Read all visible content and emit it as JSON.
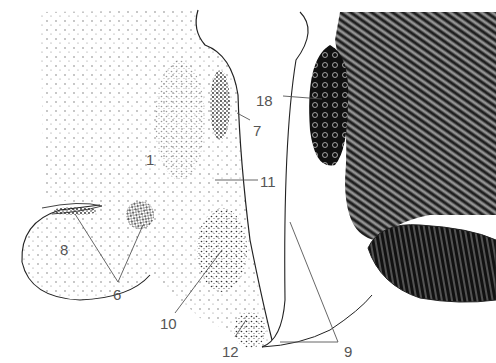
{
  "figure": {
    "type": "anatomical section illustration",
    "labels": [
      {
        "id": "1",
        "text": "1",
        "x": 116,
        "y": 157
      },
      {
        "id": "6",
        "text": "6",
        "x": 112,
        "y": 287
      },
      {
        "id": "7",
        "text": "7",
        "x": 262,
        "y": 125
      },
      {
        "id": "8",
        "text": "8",
        "x": 58,
        "y": 244
      },
      {
        "id": "9",
        "text": "9",
        "x": 342,
        "y": 345
      },
      {
        "id": "10",
        "text": "10",
        "x": 158,
        "y": 316
      },
      {
        "id": "11",
        "text": "11",
        "x": 260,
        "y": 177
      },
      {
        "id": "12",
        "text": "12",
        "x": 220,
        "y": 344
      },
      {
        "id": "18",
        "text": "18",
        "x": 256,
        "y": 95
      }
    ]
  }
}
